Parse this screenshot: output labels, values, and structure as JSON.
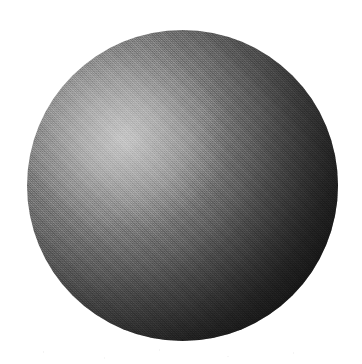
{
  "figure": {
    "caption": "",
    "background_color": "#ffffff",
    "canvas": {
      "width": 362,
      "height": 364
    },
    "sphere": {
      "center_x": 182,
      "center_y": 185,
      "radius": 155,
      "diameter": 311,
      "bounds": {
        "left": 27,
        "top": 30,
        "right": 338,
        "bottom": 341
      },
      "surface": "matte-diffuse",
      "colors": {
        "highlight": "#ababab",
        "upper_left_rim": "#8a8a8a",
        "mid_tone": "#5a5a5a",
        "right_rim": "#1a1a1a",
        "terminator": "#151515",
        "darkest": "#141414"
      },
      "lighting": {
        "direction": "upper-left",
        "highlight_x": 125,
        "highlight_y": 140,
        "highlight_relative": "31% 35%",
        "falloff": "radial-diffuse",
        "terminator_position": "lower-right"
      },
      "texture": {
        "type": "halftone-dither",
        "source": "scanned-print",
        "grain": "paper"
      }
    }
  }
}
